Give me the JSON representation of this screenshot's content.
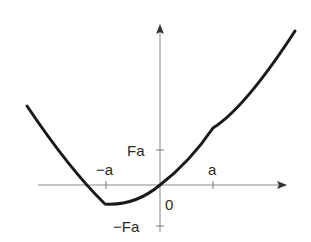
{
  "diagram": {
    "type": "function-graph",
    "axes": {
      "x_axis": {
        "has_arrow": true
      },
      "y_axis": {
        "has_arrow": true
      }
    },
    "labels": {
      "neg_a": "−a",
      "pos_a": "a",
      "Fa": "Fa",
      "neg_Fa": "−Fa",
      "origin": "0"
    },
    "colors": {
      "curve": "#1a1a1a",
      "axes": "#777777",
      "text": "#2a2a2a",
      "background": "#ffffff"
    }
  }
}
